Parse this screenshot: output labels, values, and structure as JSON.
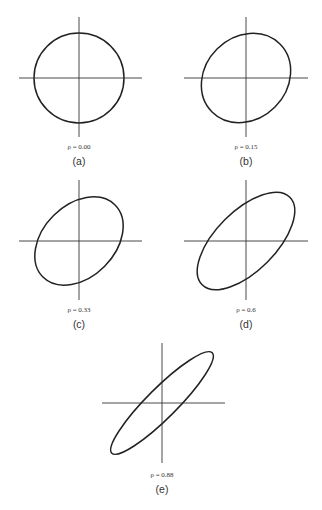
{
  "figure": {
    "panels": [
      {
        "id": "a",
        "label": "(a)",
        "rho_text": "ρ = 0.00",
        "rho": 0.0
      },
      {
        "id": "b",
        "label": "(b)",
        "rho_text": "ρ = 0.15",
        "rho": 0.15
      },
      {
        "id": "c",
        "label": "(c)",
        "rho_text": "ρ = 0.33",
        "rho": 0.33
      },
      {
        "id": "d",
        "label": "(d)",
        "rho_text": "ρ = 0.6",
        "rho": 0.6
      },
      {
        "id": "e",
        "label": "(e)",
        "rho_text": "ρ = 0.88",
        "rho": 0.88
      }
    ]
  }
}
